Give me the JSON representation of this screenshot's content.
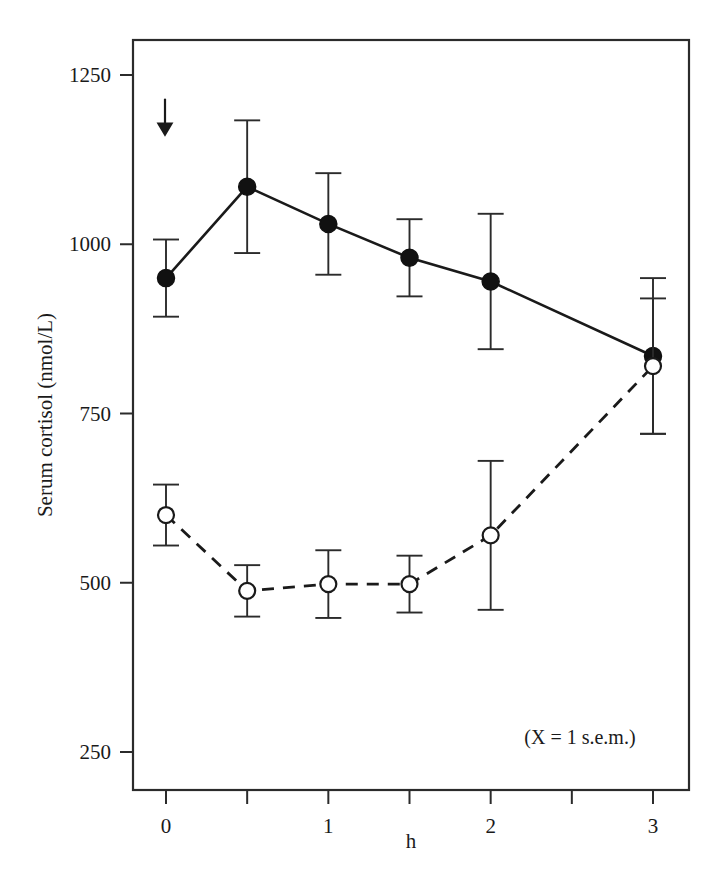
{
  "chart_data": {
    "type": "line",
    "title": "",
    "xlabel": "h",
    "ylabel": "Serum cortisol (nmol/L)",
    "x": [
      0,
      0.5,
      1,
      1.5,
      2,
      3
    ],
    "xlim": [
      -0.18,
      3.18
    ],
    "ylim": [
      180,
      1330
    ],
    "grid": false,
    "legend": "none",
    "xticks": [
      0,
      0.5,
      1,
      1.5,
      2,
      2.5,
      3
    ],
    "xtick_labels": [
      "0",
      "",
      "1",
      "",
      "2",
      "",
      "3"
    ],
    "yticks": [
      250,
      500,
      750,
      1000,
      1250
    ],
    "ytick_labels": [
      "250",
      "500",
      "750",
      "1000",
      "1250"
    ],
    "series": [
      {
        "name": "filled-circles",
        "marker": "filled-circle",
        "linestyle": "solid",
        "values": [
          950,
          1085,
          1030,
          980,
          945,
          835
        ],
        "errors": [
          57,
          98,
          75,
          57,
          100,
          115
        ]
      },
      {
        "name": "open-circles",
        "marker": "open-circle",
        "linestyle": "dashed",
        "values": [
          600,
          488,
          498,
          498,
          570,
          820
        ],
        "errors": [
          45,
          38,
          50,
          42,
          110,
          100
        ]
      }
    ],
    "annotations": [
      {
        "name": "sem-note",
        "text": "(X = 1 s.e.m.)",
        "x": 2.55,
        "y": 262
      },
      {
        "name": "dose-arrow",
        "text": "↓",
        "x": 0.0,
        "y": 1215
      }
    ]
  },
  "axes": {
    "y_title": "Serum cortisol (nmol/L)",
    "x_title": "h"
  },
  "ticks": {
    "y": [
      "1250",
      "1000",
      "750",
      "500",
      "250"
    ],
    "x": [
      "0",
      "1",
      "2",
      "3"
    ]
  },
  "notes": {
    "sem": "(X = 1 s.e.m.)"
  }
}
